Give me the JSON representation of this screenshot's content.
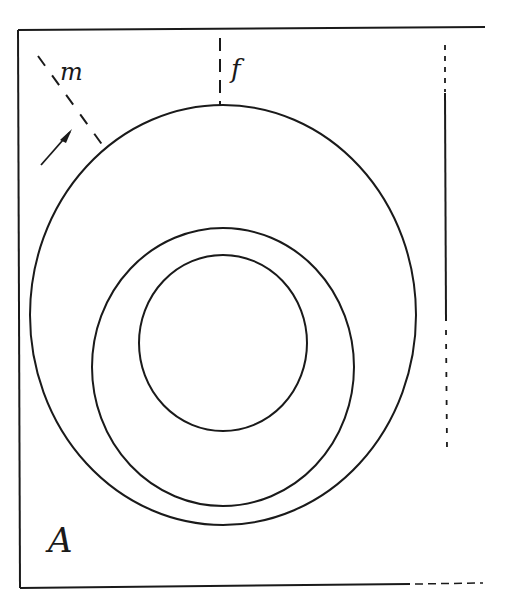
{
  "diagram": {
    "panel_label": "A",
    "labels": {
      "m": "m",
      "f": "f"
    },
    "colors": {
      "line": "#1a1a1a",
      "background": "#ffffff"
    },
    "shapes": {
      "outer_ellipse": "outer ring",
      "middle_ellipse": "middle ring",
      "inner_circle": "inner circle"
    }
  }
}
